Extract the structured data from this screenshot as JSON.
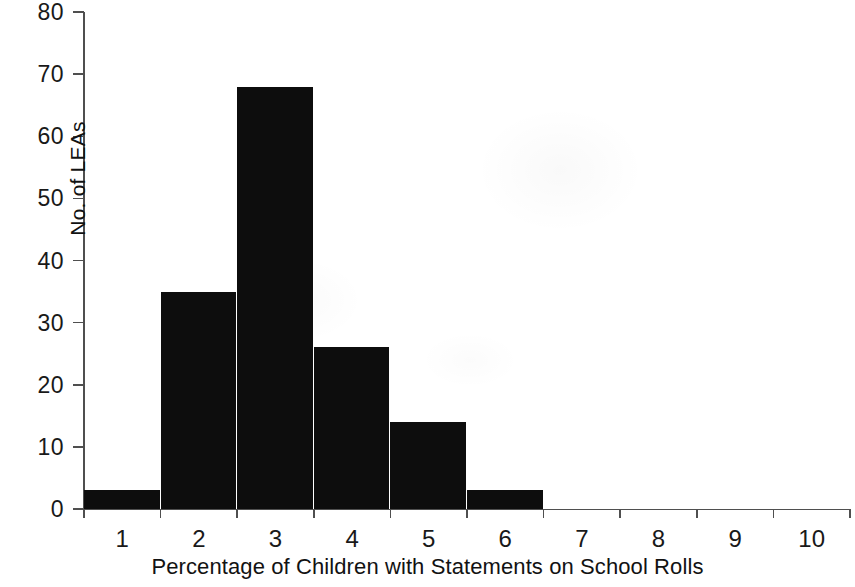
{
  "chart_data": {
    "type": "bar",
    "title": "",
    "subtitle": "",
    "xlabel": "Percentage of Children with Statements on School Rolls",
    "ylabel": "No. of LEAs",
    "categories": [
      "1",
      "2",
      "3",
      "4",
      "5",
      "6",
      "7",
      "8",
      "9",
      "10"
    ],
    "values": [
      3,
      35,
      68,
      26,
      14,
      3,
      0,
      0,
      0,
      0
    ],
    "series": [
      {
        "name": "No. of LEAs",
        "values": [
          3,
          35,
          68,
          26,
          14,
          3,
          0,
          0,
          0,
          0
        ]
      }
    ],
    "xlim": [
      0,
      10
    ],
    "ylim": [
      0,
      80
    ],
    "y_ticks": [
      0,
      10,
      20,
      30,
      40,
      50,
      60,
      70,
      80
    ],
    "y_tick_labels": [
      "0",
      "10",
      "20",
      "30",
      "40",
      "50",
      "60",
      "70",
      "80"
    ],
    "x_tick_labels": [
      "1",
      "2",
      "3",
      "4",
      "5",
      "6",
      "7",
      "8",
      "9",
      "10"
    ],
    "grid": false,
    "legend": false,
    "legend_position": "none",
    "bar_color": "#0d0d0d",
    "axis_color": "#4f4f4f",
    "text_color": "#121212",
    "background_color": "#ffffff",
    "annotations": []
  }
}
